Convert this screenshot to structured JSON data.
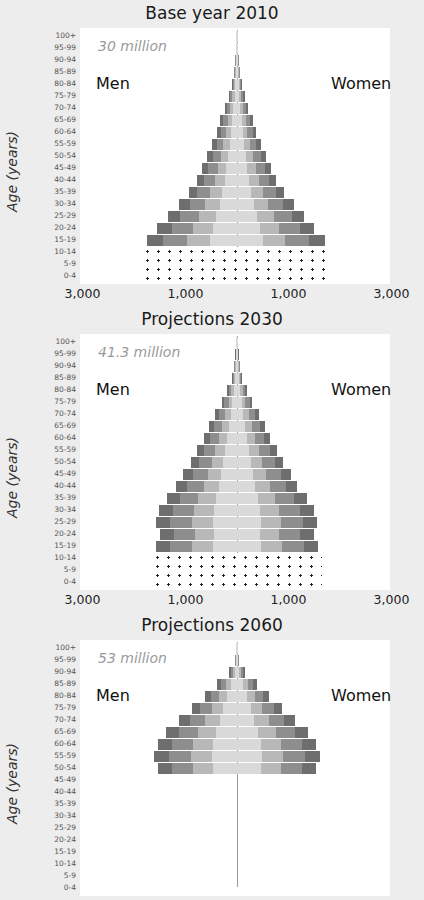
{
  "age_groups": [
    "100+",
    "95-99",
    "90-94",
    "85-89",
    "80-84",
    "75-79",
    "70-74",
    "65-69",
    "60-64",
    "55-59",
    "50-54",
    "45-49",
    "40-44",
    "35-39",
    "30-34",
    "25-29",
    "20-24",
    "15-19",
    "10-14",
    "5-9",
    "0-4"
  ],
  "y_axis_label": "Age (years)",
  "x_tick_labels": [
    "3,000",
    "1,000",
    "1,000",
    "3,000"
  ],
  "men_label": "Men",
  "women_label": "Women",
  "colors": {
    "page_bg": "#ededed",
    "plot_bg": "#ffffff",
    "outer_band": "#6e6e6e",
    "mid_band": "#8e8e8e",
    "inner_band": "#b8b8b8",
    "core_band": "#d9d9d9",
    "total_text": "#9a9a9a"
  },
  "panels": [
    {
      "title": "Base year 2010",
      "total": "30 million"
    },
    {
      "title": "Projections 2030",
      "total": "41.3 million"
    },
    {
      "title": "Projections 2060",
      "total": "53 million"
    }
  ],
  "chart_data": [
    {
      "type": "bar",
      "subtype": "population-pyramid",
      "title": "Base year 2010",
      "annotation": "30 million",
      "categories": [
        "100+",
        "95-99",
        "90-94",
        "85-89",
        "80-84",
        "75-79",
        "70-74",
        "65-69",
        "60-64",
        "55-59",
        "50-54",
        "45-49",
        "40-44",
        "35-39",
        "30-34",
        "25-29",
        "20-24",
        "15-19",
        "10-14",
        "5-9",
        "0-4"
      ],
      "series": [
        {
          "name": "Men",
          "values": [
            10,
            20,
            40,
            60,
            100,
            160,
            230,
            330,
            390,
            480,
            580,
            680,
            780,
            940,
            1120,
            1340,
            1550,
            1750,
            1850,
            1850,
            1850
          ]
        },
        {
          "name": "Women",
          "values": [
            10,
            20,
            40,
            60,
            100,
            150,
            220,
            310,
            370,
            460,
            560,
            660,
            760,
            920,
            1100,
            1300,
            1500,
            1700,
            1850,
            1850,
            1850
          ]
        }
      ],
      "notes": "Ages 0-14 shown as dotted (projected/uncertain) region",
      "xlabel": "",
      "ylabel": "Age (years)",
      "xlim": [
        -3000,
        3000
      ],
      "x_tick_labels": [
        "3,000",
        "1,000",
        "1,000",
        "3,000"
      ],
      "legend": [
        "Men",
        "Women"
      ]
    },
    {
      "type": "bar",
      "subtype": "population-pyramid",
      "title": "Projections 2030",
      "annotation": "41.3 million",
      "categories": [
        "100+",
        "95-99",
        "90-94",
        "85-89",
        "80-84",
        "75-79",
        "70-74",
        "65-69",
        "60-64",
        "55-59",
        "50-54",
        "45-49",
        "40-44",
        "35-39",
        "30-34",
        "25-29",
        "20-24",
        "15-19",
        "10-14",
        "5-9",
        "0-4"
      ],
      "series": [
        {
          "name": "Men",
          "values": [
            10,
            30,
            60,
            100,
            200,
            300,
            420,
            540,
            650,
            770,
            900,
            1040,
            1180,
            1360,
            1520,
            1580,
            1500,
            1580,
            1650,
            1650,
            1650
          ]
        },
        {
          "name": "Women",
          "values": [
            10,
            30,
            60,
            100,
            200,
            300,
            420,
            540,
            650,
            770,
            900,
            1040,
            1170,
            1350,
            1500,
            1560,
            1500,
            1580,
            1650,
            1650,
            1650
          ]
        }
      ],
      "notes": "Ages 0-14 shown as dotted region",
      "xlabel": "",
      "ylabel": "Age (years)",
      "xlim": [
        -3000,
        3000
      ],
      "x_tick_labels": [
        "3,000",
        "1,000",
        "1,000",
        "3,000"
      ],
      "legend": [
        "Men",
        "Women"
      ]
    },
    {
      "type": "bar",
      "subtype": "population-pyramid",
      "title": "Projections 2060",
      "annotation": "53 million",
      "categories": [
        "100+",
        "95-99",
        "90-94",
        "85-89",
        "80-84",
        "75-79",
        "70-74",
        "65-69",
        "60-64",
        "55-59",
        "50-54"
      ],
      "series": [
        {
          "name": "Men",
          "values": [
            10,
            40,
            150,
            380,
            620,
            880,
            1120,
            1370,
            1540,
            1620,
            1540
          ]
        },
        {
          "name": "Women",
          "values": [
            10,
            40,
            150,
            380,
            620,
            880,
            1120,
            1370,
            1540,
            1620,
            1540
          ]
        }
      ],
      "notes": "Chart cropped at bottom of screenshot",
      "xlabel": "",
      "ylabel": "Age (years)",
      "xlim": [
        -3000,
        3000
      ],
      "legend": [
        "Men",
        "Women"
      ]
    }
  ]
}
